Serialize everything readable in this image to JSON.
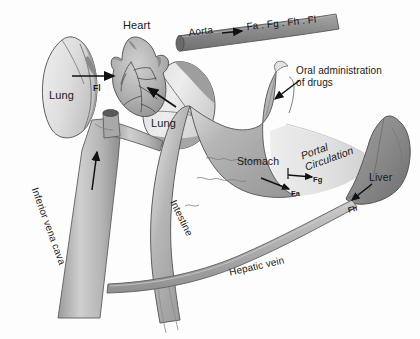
{
  "figure": {
    "background_color": "#fdfdfd",
    "ink_color": "#1a1a1a"
  },
  "labels": {
    "heart": "Heart",
    "lung_left": "Lung",
    "lung_right": "Lung",
    "aorta": "Aorta",
    "f_sequence": "Fa . Fg . Fh . Fl",
    "oral_administration": "Oral administration\nof drugs",
    "oral_administration_line1": "Oral administration",
    "oral_administration_line2": "of drugs",
    "stomach": "Stomach",
    "portal_circulation": "Portal\nCirculation",
    "portal_circulation_line1": "Portal",
    "portal_circulation_line2": "Circulation",
    "liver": "Liver",
    "intestine": "Intestine",
    "inferior_vena_cava": "Inferior vena cava",
    "hepatic_vein": "Hepatic vein"
  },
  "fraction_labels": {
    "fa": "Fa",
    "fg": "Fg",
    "fh": "Fh",
    "fl": "Fl"
  },
  "colors": {
    "lung_fill": "#e2e2e2",
    "lung_shade": "#9a9a9a",
    "heart_fill": "#b8b8b8",
    "vessel_fill": "#b4b4b4",
    "aorta_fill": "#8f8f8f",
    "gut_fill": "#a9a9a9",
    "liver_fill": "#8d8d8d",
    "portal_fill": "#dcdcdc",
    "outline": "#4a4a4a",
    "arrow": "#111111"
  }
}
